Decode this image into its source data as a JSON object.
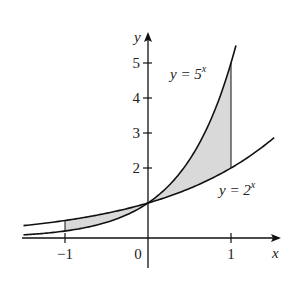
{
  "figure": {
    "axis_x_label": "x",
    "axis_y_label": "y",
    "x_ticks": [
      {
        "value": -1,
        "label": "−1"
      },
      {
        "value": 0,
        "label": "0"
      },
      {
        "value": 1,
        "label": "1"
      }
    ],
    "y_ticks": [
      {
        "value": 2,
        "label": "2"
      },
      {
        "value": 3,
        "label": "3"
      },
      {
        "value": 4,
        "label": "4"
      },
      {
        "value": 5,
        "label": "5"
      }
    ],
    "curves": [
      {
        "name": "y = 5^x",
        "label_lhs": "y = 5",
        "label_exp": "x",
        "base": 5
      },
      {
        "name": "y = 2^x",
        "label_lhs": "y = 2",
        "label_exp": "x",
        "base": 2
      }
    ],
    "shaded_region": {
      "x_from": -1,
      "x_to": 1,
      "description": "Area between y=5^x and y=2^x from x=-1 to x=1"
    },
    "colors": {
      "curve": "#111111",
      "shade": "#d9d9d9",
      "axis": "#111111"
    }
  },
  "chart_data": {
    "type": "line",
    "title": "",
    "xlabel": "x",
    "ylabel": "y",
    "xlim": [
      -1.75,
      1.6
    ],
    "ylim": [
      -0.8,
      5.5
    ],
    "x_ticks": [
      -1,
      0,
      1
    ],
    "y_ticks": [
      2,
      3,
      4,
      5
    ],
    "grid": false,
    "series": [
      {
        "name": "y = 5^x",
        "x": [
          -1.75,
          -1,
          -0.5,
          0,
          0.5,
          1,
          1.07
        ],
        "values": [
          0.06,
          0.2,
          0.45,
          1,
          2.24,
          5,
          5.6
        ]
      },
      {
        "name": "y = 2^x",
        "x": [
          -1.75,
          -1,
          -0.5,
          0,
          0.5,
          1,
          1.5
        ],
        "values": [
          0.3,
          0.5,
          0.71,
          1,
          1.41,
          2,
          2.83
        ]
      }
    ],
    "annotations": [
      {
        "text": "y = 5^x",
        "x": 0.55,
        "y": 4.6
      },
      {
        "text": "y = 2^x",
        "x": 1.1,
        "y": 1.4
      },
      {
        "text": "shaded region between curves on [-1, 1]"
      }
    ]
  }
}
